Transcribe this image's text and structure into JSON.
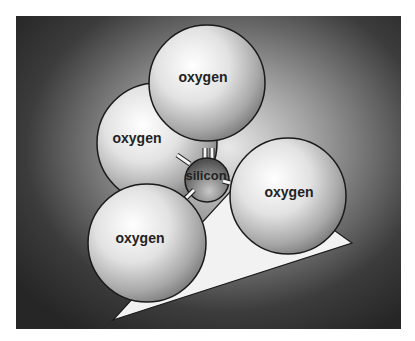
{
  "diagram": {
    "title": "",
    "frame": {
      "x": 16,
      "y": 16,
      "width": 385,
      "height": 313
    },
    "colors": {
      "background_dark": "#2a2a2a",
      "background_glow": "#d8d8d8",
      "sphere_light": "#ffffff",
      "sphere_dark": "#6e6e6e",
      "silicon_dark": "#555555",
      "silicon_light": "#b0b0b0",
      "outline": "#1a1a1a",
      "triangle": "#f2f2f2",
      "bond": "#f4f4f4"
    },
    "atoms": [
      {
        "id": "oxygen-left",
        "label": "oxygen",
        "cx": 157,
        "cy": 143,
        "r": 60
      },
      {
        "id": "oxygen-top",
        "label": "oxygen",
        "cx": 207,
        "cy": 83,
        "r": 58
      },
      {
        "id": "oxygen-right",
        "label": "oxygen",
        "cx": 288,
        "cy": 196,
        "r": 58
      },
      {
        "id": "oxygen-bottom",
        "label": "oxygen",
        "cx": 147,
        "cy": 243,
        "r": 59
      }
    ],
    "center_atom": {
      "id": "silicon",
      "label": "silicon",
      "cx": 207,
      "cy": 180,
      "r": 22
    },
    "base_triangle": {
      "points": "113,320 352,243 250,170"
    }
  }
}
